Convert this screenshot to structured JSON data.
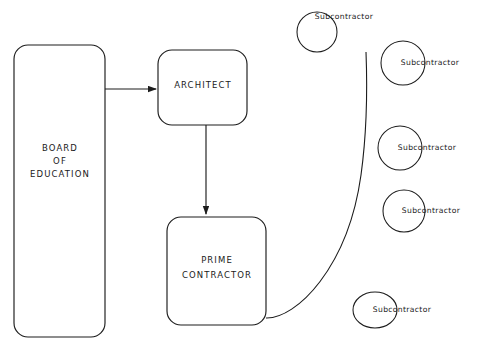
{
  "diagram": {
    "background_color": "#ffffff",
    "stroke_color": "#1c1c1c",
    "canvas": {
      "width": 479,
      "height": 353
    },
    "boxes": [
      {
        "id": "board-of-education",
        "label_line1": "BOARD",
        "label_line2": "OF",
        "label_line3": "EDUCATION",
        "x": 14,
        "y": 45,
        "width": 91,
        "height": 292,
        "radius": 14,
        "text_center_x": 60,
        "text_center_y": 160
      },
      {
        "id": "architect",
        "label_line1": "ARCHITECT",
        "x": 158,
        "y": 50,
        "width": 89,
        "height": 75,
        "radius": 14,
        "text_center_x": 203,
        "text_center_y": 85
      },
      {
        "id": "prime-contractor",
        "label_line1": "PRIME",
        "label_line2": "CONTRACTOR",
        "x": 167,
        "y": 217,
        "width": 99,
        "height": 108,
        "radius": 14,
        "text_center_x": 217,
        "text_center_y": 265
      }
    ],
    "circles": [
      {
        "id": "subcontractor-1",
        "label": "Subcontractor",
        "cx": 317,
        "cy": 32,
        "rx": 20,
        "ry": 20,
        "text_x": 344,
        "text_y": 17
      },
      {
        "id": "subcontractor-2",
        "label": "Subcontractor",
        "cx": 403,
        "cy": 63,
        "rx": 22,
        "ry": 22,
        "text_x": 430,
        "text_y": 63
      },
      {
        "id": "subcontractor-3",
        "label": "Subcontractor",
        "cx": 400,
        "cy": 148,
        "rx": 22,
        "ry": 22,
        "text_x": 427,
        "text_y": 148
      },
      {
        "id": "subcontractor-4",
        "label": "Subcontractor",
        "cx": 404,
        "cy": 211,
        "rx": 21,
        "ry": 21,
        "text_x": 431,
        "text_y": 211
      },
      {
        "id": "subcontractor-5",
        "label": "Subcontractor",
        "cx": 375,
        "cy": 310,
        "rx": 22,
        "ry": 18,
        "text_x": 402,
        "text_y": 310
      }
    ],
    "connectors": [
      {
        "id": "board-to-architect",
        "type": "arrow-horizontal",
        "from": "board-of-education",
        "to": "architect",
        "x1": 105,
        "y1": 89,
        "x2": 158,
        "y2": 89
      },
      {
        "id": "architect-to-prime-contractor",
        "type": "arrow-vertical",
        "from": "architect",
        "to": "prime-contractor",
        "x1": 206,
        "y1": 125,
        "x2": 206,
        "y2": 216
      },
      {
        "id": "prime-contractor-to-subcontractors",
        "type": "curve",
        "from": "prime-contractor",
        "to": "subcontractors",
        "path": "M 266 318 C 300 318, 350 260, 366 52"
      }
    ]
  }
}
